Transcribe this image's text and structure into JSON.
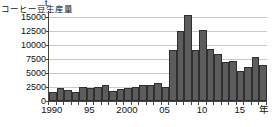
{
  "chart_data": {
    "type": "bar",
    "title": "",
    "ylabel": "コーヒー豆生産量",
    "xlabel": "年",
    "yunit": "t",
    "ylim": [
      0,
      16000
    ],
    "yticks": [
      0,
      2500,
      5000,
      7500,
      10000,
      12500,
      15000
    ],
    "ytick_labels": [
      "0",
      "2500",
      "5000",
      "7500",
      "10000",
      "12500",
      "15000"
    ],
    "grid": true,
    "legend": "none",
    "bar_color": "#5c5c5c",
    "categories": [
      "1990",
      "1991",
      "1992",
      "1993",
      "1994",
      "1995",
      "1996",
      "1997",
      "1998",
      "1999",
      "2000",
      "2001",
      "2002",
      "2003",
      "2004",
      "2005",
      "2006",
      "2007",
      "2008",
      "2009",
      "2010",
      "2011",
      "2012",
      "2013",
      "2014",
      "2015",
      "2016",
      "2017",
      "2018"
    ],
    "values": [
      1600,
      2250,
      1950,
      1550,
      2450,
      2400,
      2500,
      2850,
      1850,
      2200,
      2300,
      2500,
      2900,
      2800,
      3200,
      2550,
      9000,
      12500,
      15300,
      9150,
      12600,
      9300,
      8300,
      6950,
      7150,
      5400,
      6050,
      7800,
      6450
    ],
    "xtick_years": [
      "1990",
      "95",
      "2000",
      "05",
      "10",
      "15"
    ],
    "xtick_indices": [
      0,
      5,
      10,
      15,
      20,
      25
    ]
  }
}
